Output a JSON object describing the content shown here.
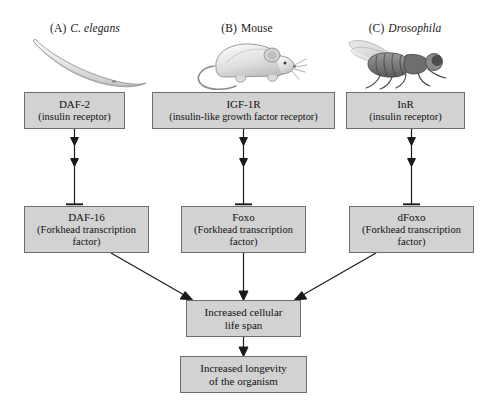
{
  "figure": {
    "background_color": "#ffffff",
    "box_fill": "#d2d2d2",
    "box_border": "#6e6e6e",
    "line_color": "#1a1a1a"
  },
  "columns": [
    {
      "id": "c-elegans",
      "tag": "(A)",
      "name": "C. elegans",
      "name_italic": true,
      "organism_icon": "nematode-worm-icon"
    },
    {
      "id": "mouse",
      "tag": "(B)",
      "name": "Mouse",
      "name_italic": false,
      "organism_icon": "mouse-icon"
    },
    {
      "id": "drosophila",
      "tag": "(C)",
      "name": "Drosophila",
      "name_italic": true,
      "organism_icon": "fruit-fly-icon"
    }
  ],
  "receptors": [
    {
      "id": "daf-2",
      "gene": "DAF-2",
      "description": "(insulin receptor)"
    },
    {
      "id": "igf-1r",
      "gene": "IGF-1R",
      "description": "(insulin-like growth factor receptor)"
    },
    {
      "id": "inr",
      "gene": "InR",
      "description": "(insulin receptor)"
    }
  ],
  "transcription_factors": [
    {
      "id": "daf-16",
      "gene": "DAF-16",
      "description_line1": "(Forkhead transcription",
      "description_line2": "factor)"
    },
    {
      "id": "foxo",
      "gene": "Foxo",
      "description_line1": "(Forkhead transcription",
      "description_line2": "factor)"
    },
    {
      "id": "dfoxo",
      "gene": "dFoxo",
      "description_line1": "(Forkhead transcription",
      "description_line2": "factor)"
    }
  ],
  "outcomes": [
    {
      "id": "cellular-life-span",
      "line1": "Increased cellular",
      "line2": "life span"
    },
    {
      "id": "organism-longevity",
      "line1": "Increased longevity",
      "line2": "of the organism"
    }
  ],
  "connectors": [
    {
      "id": "daf2-to-daf16",
      "from": "daf-2",
      "to": "daf-16",
      "type": "inhibition",
      "arrowheads": 2,
      "terminator": "bar"
    },
    {
      "id": "igf1r-to-foxo",
      "from": "igf-1r",
      "to": "foxo",
      "type": "inhibition",
      "arrowheads": 2,
      "terminator": "bar"
    },
    {
      "id": "inr-to-dfoxo",
      "from": "inr",
      "to": "dfoxo",
      "type": "inhibition",
      "arrowheads": 2,
      "terminator": "bar"
    },
    {
      "id": "daf16-to-lifespan",
      "from": "daf-16",
      "to": "cellular-life-span",
      "type": "activation",
      "arrowheads": 1,
      "terminator": "arrow"
    },
    {
      "id": "foxo-to-lifespan",
      "from": "foxo",
      "to": "cellular-life-span",
      "type": "activation",
      "arrowheads": 1,
      "terminator": "arrow"
    },
    {
      "id": "dfoxo-to-lifespan",
      "from": "dfoxo",
      "to": "cellular-life-span",
      "type": "activation",
      "arrowheads": 1,
      "terminator": "arrow"
    },
    {
      "id": "lifespan-to-longevity",
      "from": "cellular-life-span",
      "to": "organism-longevity",
      "type": "activation",
      "arrowheads": 1,
      "terminator": "arrow"
    }
  ]
}
